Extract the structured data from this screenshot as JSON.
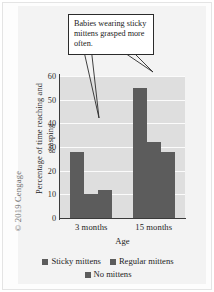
{
  "figure": {
    "copyright": "© 2019 Cengage"
  },
  "annotation": {
    "text": "Babies wearing sticky mittens grasped more often."
  },
  "chart_data": {
    "type": "bar",
    "title": "",
    "xlabel": "Age",
    "ylabel_line1": "Percentage of time reaching and",
    "ylabel_line2": "grasping",
    "ylabel": "Percentage of time reaching and grasping",
    "categories": [
      "3 months",
      "15 months"
    ],
    "series": [
      {
        "name": "Sticky mittens",
        "values": [
          28,
          55
        ],
        "color": "#5c5c5c"
      },
      {
        "name": "Regular mittens",
        "values": [
          10,
          32
        ],
        "color": "#5c5c5c"
      },
      {
        "name": "No mittens",
        "values": [
          12,
          28
        ],
        "color": "#5c5c5c"
      }
    ],
    "ylim": [
      0,
      60
    ],
    "yticks": [
      0,
      10,
      20,
      30,
      40,
      50,
      60
    ],
    "ytick_labels": [
      "0",
      "10",
      "20",
      "30",
      "40",
      "50",
      "60"
    ],
    "grid": true,
    "legend_position": "bottom",
    "annotations": [
      "Babies wearing sticky mittens grasped more often."
    ]
  },
  "legend": {
    "items": [
      {
        "label": "Sticky mittens"
      },
      {
        "label": "Regular mittens"
      },
      {
        "label": "No mittens"
      }
    ]
  }
}
